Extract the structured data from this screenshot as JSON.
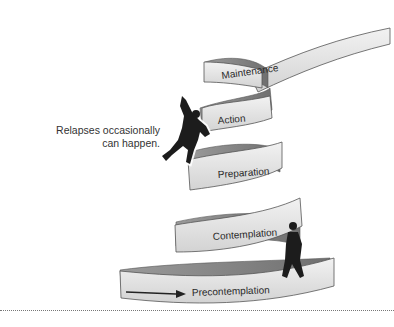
{
  "diagram": {
    "stages": [
      {
        "label": "Maintenance"
      },
      {
        "label": "Action"
      },
      {
        "label": "Preparation"
      },
      {
        "label": "Contemplation"
      },
      {
        "label": "Precontemplation"
      }
    ],
    "annotation": {
      "line1": "Relapses occasionally",
      "line2": "can happen."
    },
    "colors": {
      "ribbon_face": "#e6e6e6",
      "ribbon_shadow": "#8f8f8f",
      "figure": "#1c1c1c"
    }
  }
}
